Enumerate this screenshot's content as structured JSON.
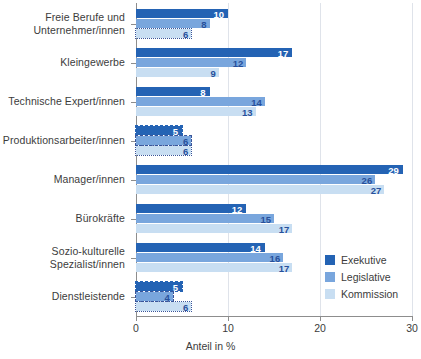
{
  "chart_data": {
    "type": "bar",
    "orientation": "horizontal",
    "title": "",
    "subtitle": "",
    "xlabel": "Anteil in %",
    "ylabel": "",
    "xlim": [
      0,
      30
    ],
    "xticks": [
      0,
      10,
      20,
      30
    ],
    "grid": "vertical",
    "legend_position": "inside-bottom-right",
    "categories": [
      "Freie Berufe und\nUnternehmer/innen",
      "Kleingewerbe",
      "Technische Expert/innen",
      "Produktionsarbeiter/innen",
      "Manager/innen",
      "Bürokräfte",
      "Sozio-kulturelle\nSpezialist/innen",
      "Dienstleistende"
    ],
    "series": [
      {
        "name": "Exekutive",
        "color": "#2463b4",
        "values": [
          10,
          17,
          8,
          5,
          29,
          12,
          14,
          5
        ]
      },
      {
        "name": "Legislative",
        "color": "#79a6dd",
        "values": [
          8,
          12,
          14,
          6,
          26,
          15,
          16,
          4
        ]
      },
      {
        "name": "Kommission",
        "color": "#c8def2",
        "values": [
          6,
          9,
          13,
          6,
          27,
          17,
          17,
          6
        ]
      }
    ],
    "data_labels": [
      [
        "10",
        "8",
        "6"
      ],
      [
        "17",
        "12",
        "9"
      ],
      [
        "8",
        "14",
        "13"
      ],
      [
        "5",
        "6",
        "6"
      ],
      [
        "29",
        "26",
        "27"
      ],
      [
        "12",
        "15",
        "17"
      ],
      [
        "14",
        "16",
        "17"
      ],
      [
        "5",
        "4",
        "6"
      ]
    ]
  },
  "legend": {
    "items": [
      {
        "label": "Exekutive",
        "color": "#2463b4"
      },
      {
        "label": "Legislative",
        "color": "#79a6dd"
      },
      {
        "label": "Kommission",
        "color": "#c8def2"
      }
    ]
  },
  "axis": {
    "x_title": "Anteil in %",
    "x_tick_labels": [
      "0",
      "10",
      "20",
      "30"
    ]
  }
}
